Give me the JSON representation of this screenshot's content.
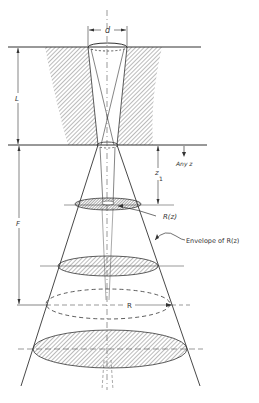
{
  "diagram": {
    "labels": {
      "d": "d",
      "L": "L",
      "F": "F",
      "any_z": "Any z",
      "z1": "z",
      "z1_sub": "1",
      "R_z": "R(z)",
      "envelope": "Envelope of R(z)",
      "R": "R"
    },
    "colors": {
      "line": "#333333",
      "hatch": "#555555",
      "background": "#ffffff"
    }
  }
}
